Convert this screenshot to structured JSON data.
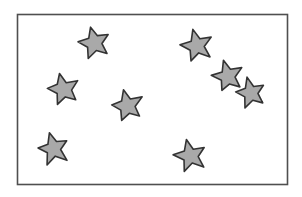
{
  "image": {
    "title": "Star Flag Illustration",
    "description": "Hand-drawn style rectangular flag outline containing eight gray five-pointed stars",
    "width": 302,
    "height": 197,
    "background_color": "#ffffff"
  },
  "flag": {
    "name": "flag-outline",
    "x": 17.5,
    "y": 14.5,
    "width": 270,
    "height": 170,
    "fill_color": "#ffffff",
    "stroke_color": "#4f4f4f",
    "stroke_width": 1.6
  },
  "star_style": {
    "fill_color": "#a9a9a9",
    "stroke_color": "#333333",
    "stroke_width": 1.6,
    "points": 5,
    "inner_ratio": 0.46
  },
  "stars": [
    {
      "name": "star-top-left",
      "cx": 94.5,
      "cy": 43.0,
      "r": 16.5,
      "rotation": -14
    },
    {
      "name": "star-upper-left",
      "cx": 63.5,
      "cy": 89.5,
      "r": 16.5,
      "rotation": -14
    },
    {
      "name": "star-center",
      "cx": 127.5,
      "cy": 106.0,
      "r": 16.5,
      "rotation": -14
    },
    {
      "name": "star-bottom-left",
      "cx": 53.5,
      "cy": 149.0,
      "r": 16.5,
      "rotation": -14
    },
    {
      "name": "star-bottom-center",
      "cx": 190.5,
      "cy": 156.0,
      "r": 16.5,
      "rotation": -14
    },
    {
      "name": "star-top-right",
      "cx": 197.0,
      "cy": 46.0,
      "r": 16.5,
      "rotation": -14
    },
    {
      "name": "star-right-upper",
      "cx": 227.5,
      "cy": 76.5,
      "r": 16.0,
      "rotation": -14
    },
    {
      "name": "star-right-lower",
      "cx": 251.0,
      "cy": 93.0,
      "r": 15.5,
      "rotation": -14
    }
  ]
}
